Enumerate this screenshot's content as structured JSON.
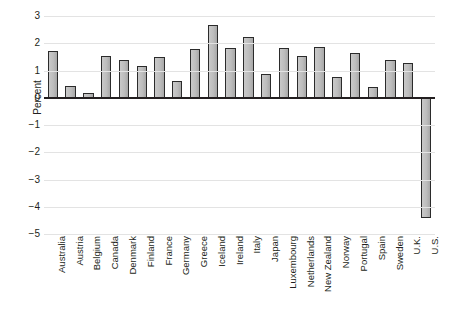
{
  "chart_data": {
    "type": "bar",
    "title": "",
    "xlabel": "",
    "ylabel": "Percent",
    "ylim": [
      -5,
      3
    ],
    "yticks": [
      3,
      2,
      1,
      0,
      -1,
      -2,
      -3,
      -4,
      -5
    ],
    "ytick_labels": [
      "3",
      "2",
      "1",
      "0",
      "−1",
      "−2",
      "−3",
      "−4",
      "−5"
    ],
    "grid": true,
    "legend": "none",
    "bar_color": "#bdbdbd",
    "bar_edge_color": "#2b2b2b",
    "categories": [
      "Australia",
      "Austria",
      "Belgium",
      "Canada",
      "Denmark",
      "Finland",
      "France",
      "Germany",
      "Greece",
      "Iceland",
      "Ireland",
      "Italy",
      "Japan",
      "Luxembourg",
      "Netherlands",
      "New Zealand",
      "Norway",
      "Portugal",
      "Spain",
      "Sweden",
      "U.K.",
      "U.S."
    ],
    "values": [
      1.73,
      0.42,
      0.17,
      1.55,
      1.37,
      1.18,
      1.51,
      0.63,
      1.78,
      2.66,
      1.81,
      2.23,
      0.86,
      1.81,
      1.54,
      1.85,
      0.76,
      1.63,
      0.41,
      1.37,
      1.28,
      -4.43
    ]
  }
}
